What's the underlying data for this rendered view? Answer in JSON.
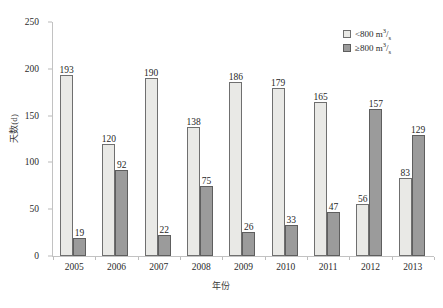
{
  "chart_data": {
    "type": "bar",
    "title": "",
    "xlabel": "年份",
    "ylabel": "天数(d)",
    "ylim": [
      0,
      250
    ],
    "yticks": [
      0,
      50,
      100,
      150,
      200,
      250
    ],
    "grid": false,
    "legend_position": "top-right",
    "categories": [
      "2005",
      "2006",
      "2007",
      "2008",
      "2009",
      "2010",
      "2011",
      "2012",
      "2013"
    ],
    "series": [
      {
        "name": "< 800 m3/s",
        "name_prefix": "<",
        "name_number": "800",
        "name_unit_base": "m",
        "name_unit_sup": "3",
        "name_unit_sub": "s",
        "values": [
          193,
          120,
          190,
          138,
          186,
          179,
          165,
          56,
          83
        ]
      },
      {
        "name": "≥ 800 m3/s",
        "name_prefix": "≥",
        "name_number": "800",
        "name_unit_base": "m",
        "name_unit_sup": "3",
        "name_unit_sub": "s",
        "values": [
          19,
          92,
          22,
          75,
          26,
          33,
          47,
          157,
          129
        ]
      }
    ]
  }
}
